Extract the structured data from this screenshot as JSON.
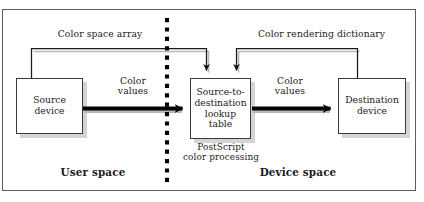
{
  "figure": {
    "background_color": "#ffffff",
    "frame_color": "#5d5d5d",
    "text_color": "#1b1b1b",
    "arrow_color": "#000000",
    "shadow_color": "#b0b0b0",
    "divider_color": "#000000"
  },
  "nodes": {
    "source": {
      "label": "Source\ndevice"
    },
    "lookup": {
      "label": "Source-to-\ndestination\nlookup\ntable"
    },
    "destination": {
      "label": "Destination\ndevice"
    }
  },
  "edge_labels": {
    "color_values_left": "Color\nvalues",
    "color_values_right": "Color\nvalues",
    "color_space_array": "Color space array",
    "color_rendering_dictionary": "Color rendering dictionary"
  },
  "annotations": {
    "postscript_processing": "PostScript\ncolor processing"
  },
  "regions": {
    "user_space": "User space",
    "device_space": "Device space"
  }
}
